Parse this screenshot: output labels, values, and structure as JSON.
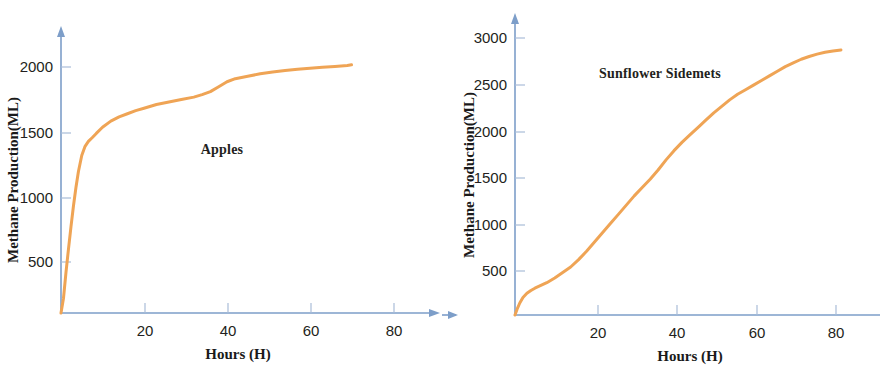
{
  "chart_data": [
    {
      "type": "line",
      "title": "Apples",
      "xlabel": "Hours (H)",
      "ylabel": "Methane Production(ML)",
      "xlim": [
        0,
        92
      ],
      "ylim": [
        0,
        2250
      ],
      "xticks": [
        20,
        40,
        60,
        80
      ],
      "yticks": [
        500,
        1000,
        1500,
        2000
      ],
      "grid": false,
      "legend": "none",
      "line_color": "#EFA455",
      "axis_color": "#7d9ec9",
      "series": [
        {
          "name": "Apples",
          "x": [
            0,
            0.6,
            1.2,
            1.8,
            2.4,
            3.0,
            3.6,
            4.2,
            5.0,
            5.8,
            6.6,
            7.5,
            8.5,
            10,
            12,
            14,
            16,
            18,
            20,
            23,
            26,
            29,
            32,
            34,
            36,
            38,
            40,
            42,
            45,
            48,
            51,
            54,
            57,
            60,
            63,
            66,
            69,
            70
          ],
          "y": [
            0,
            120,
            330,
            520,
            700,
            870,
            1020,
            1150,
            1280,
            1355,
            1395,
            1425,
            1460,
            1510,
            1560,
            1595,
            1620,
            1645,
            1665,
            1695,
            1715,
            1735,
            1755,
            1775,
            1800,
            1840,
            1880,
            1905,
            1925,
            1945,
            1960,
            1972,
            1982,
            1990,
            1998,
            2005,
            2012,
            2018
          ]
        }
      ]
    },
    {
      "type": "line",
      "title": "Sunflower  Sidemets",
      "xlabel": "Hours (H)",
      "ylabel": "Methane Production(ML)",
      "xlim": [
        0,
        92
      ],
      "ylim": [
        0,
        3200
      ],
      "xticks": [
        20,
        40,
        60,
        80
      ],
      "yticks": [
        500,
        1000,
        1500,
        2000,
        2500,
        3000
      ],
      "grid": false,
      "legend": "none",
      "line_color": "#EFA455",
      "axis_color": "#7d9ec9",
      "series": [
        {
          "name": "Sunflower  Sidemets",
          "x": [
            0,
            0.5,
            1.2,
            2.0,
            3.0,
            4.0,
            5.0,
            6.5,
            8.0,
            10,
            12,
            14,
            16,
            18,
            20,
            22,
            24,
            26,
            28,
            30,
            32,
            34,
            36,
            38,
            40,
            42,
            44,
            46,
            48,
            50,
            52,
            54,
            56,
            58,
            60,
            62,
            64,
            66,
            68,
            70,
            72,
            74,
            76,
            78,
            80,
            82
          ],
          "y": [
            0,
            60,
            130,
            190,
            235,
            265,
            290,
            320,
            350,
            400,
            460,
            520,
            600,
            690,
            790,
            890,
            990,
            1090,
            1190,
            1290,
            1380,
            1470,
            1570,
            1680,
            1780,
            1870,
            1950,
            2030,
            2110,
            2190,
            2260,
            2330,
            2390,
            2440,
            2490,
            2540,
            2590,
            2640,
            2690,
            2730,
            2770,
            2800,
            2825,
            2845,
            2860,
            2870
          ]
        }
      ]
    }
  ],
  "panels": [
    {
      "id": "apples",
      "series_label": "Apples",
      "xlabel": "Hours (H)",
      "ylabel": "Methane Production(ML)",
      "xticks": [
        "20",
        "40",
        "60",
        "80"
      ],
      "yticks": [
        "2000",
        "1500",
        "1000",
        "500"
      ]
    },
    {
      "id": "sunflower",
      "series_label": "Sunflower  Sidemets",
      "xlabel": "Hours (H)",
      "ylabel": "Methane Production(ML)",
      "xticks": [
        "20",
        "40",
        "60",
        "80"
      ],
      "yticks": [
        "3000",
        "2500",
        "2000",
        "1500",
        "1000",
        "500"
      ]
    }
  ],
  "colors": {
    "line": "#EFA455",
    "axis": "#7d9ec9",
    "tick": "#a9bcd8",
    "text": "#231f20"
  }
}
